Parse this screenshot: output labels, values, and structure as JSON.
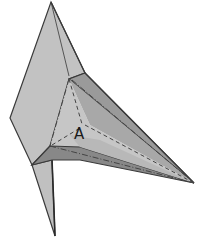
{
  "diagram": {
    "type": "origami-fold-step",
    "colors": {
      "paper_light": "#c4c4c4",
      "paper_mid": "#b4b4b4",
      "paper_dark": "#8e8e8e",
      "paper_shadow": "#7a7a7a",
      "edge": "#3a3a3a",
      "crease": "#444444"
    },
    "labels": [
      {
        "id": "point-a",
        "text": "A",
        "x": 74,
        "y": 127
      }
    ],
    "crease_types": [
      "mountain-fold (dash-dot)",
      "valley-fold (dashed)"
    ]
  }
}
